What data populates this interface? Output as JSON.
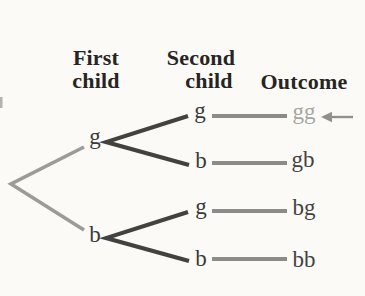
{
  "headers": {
    "first_line1": "First",
    "first_line2": "child",
    "second_line1": "Second",
    "second_line2": "child",
    "outcome": "Outcome"
  },
  "tree": {
    "first_child": {
      "g": "g",
      "b": "b"
    },
    "second_child": {
      "after_g_g": "g",
      "after_g_b": "b",
      "after_b_g": "g",
      "after_b_b": "b"
    },
    "outcomes": {
      "gg": "gg",
      "gb": "gb",
      "bg": "bg",
      "bb": "bb"
    },
    "highlighted_outcome": "gg",
    "highlight_marker": "left-arrow"
  },
  "colors": {
    "background": "#fbfaf7",
    "header_text": "#262523",
    "node_text": "#3a3938",
    "outcome_text": "#434240",
    "highlight_text": "#a7a5a0",
    "branch_level1": "#9b9b99",
    "branch_level2": "#424240",
    "outcome_line": "#8b8b89",
    "arrow": "#8f8f8d",
    "edge_artifact": "#b3b2af"
  }
}
